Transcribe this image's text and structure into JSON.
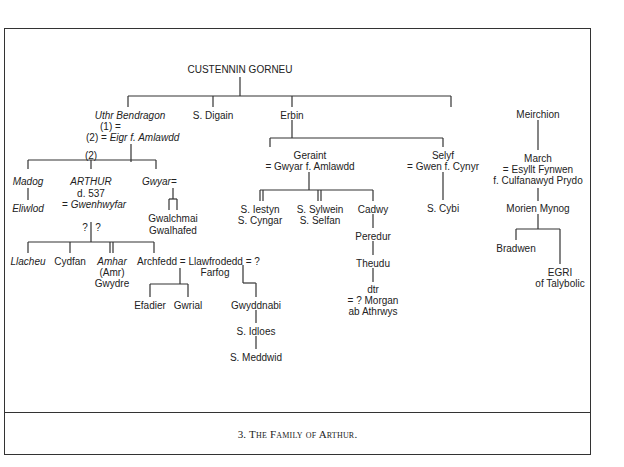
{
  "caption": "3.  The Family of Arthur.",
  "root": "CUSTENNIN GORNEU",
  "people": {
    "uthr": "Uthr Bendragon",
    "digain": "S. Digain",
    "erbin": "Erbin",
    "meirchion": "Meirchion",
    "uthr_m1": "(1) =",
    "uthr_m2_prefix": "(2) = ",
    "uthr_m2_name": "Eigr f. Amlawdd",
    "marriage2_marker": "(2)",
    "madog": "Madog",
    "eliwlod": "Eliwlod",
    "arthur": "ARTHUR",
    "arthur_death": "d. 537",
    "arthur_spouse_prefix": "= ",
    "arthur_spouse": "Gwenhwyfar",
    "q1": "?",
    "q2": "?",
    "gwyar": "Gwyar",
    "gwyar_eq": "=",
    "gwalchmai": "Gwalchmai",
    "gwalhafed": "Gwalhafed",
    "llacheu": "Llacheu",
    "cydfan": "Cydfan",
    "amhar": "Amhar",
    "amr": "(Amr)",
    "gwydre": "Gwydre",
    "archfedd_line": "Archfedd = Llawfrodedd = ?",
    "farfog": "Farfog",
    "efadier": "Efadier",
    "gwrial": "Gwrial",
    "gwyddnabi": "Gwyddnabi",
    "idloes": "S. Idloes",
    "meddwid": "S. Meddwid",
    "geraint": "Geraint",
    "geraint_spouse": "= Gwyar f. Amlawdd",
    "iestyn": "S. Iestyn",
    "cyngar": "S. Cyngar",
    "sylwein": "S. Sylwein",
    "selfan": "S. Selfan",
    "cadwy": "Cadwy",
    "peredur": "Peredur",
    "theudu": "Theudu",
    "dtr": "dtr",
    "morgan": "= ? Morgan",
    "athrwys": "ab Athrwys",
    "selyf": "Selyf",
    "selyf_spouse": "= Gwen f. Cynyr",
    "cybi": "S. Cybi",
    "march": "March",
    "march_spouse1": "= Esyllt Fynwen",
    "march_spouse2": "f. Culfanawyd Prydo",
    "morien": "Morien Mynog",
    "bradwen": "Bradwen",
    "egri": "EGRI",
    "egri_of": "of Talybolic"
  }
}
